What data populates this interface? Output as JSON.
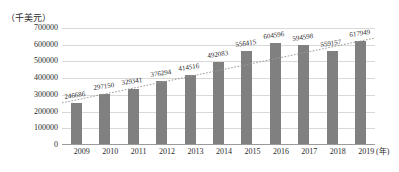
{
  "chart_data": {
    "type": "bar",
    "title": "",
    "subtitle": "",
    "xlabel": "(年)",
    "ylabel": "（千美元）",
    "categories": [
      "2009",
      "2010",
      "2011",
      "2012",
      "2013",
      "2014",
      "2015",
      "2016",
      "2017",
      "2018",
      "2019"
    ],
    "values": [
      246686,
      297150,
      329341,
      376294,
      414516,
      492083,
      556415,
      604596,
      594598,
      559157,
      617949
    ],
    "data_labels": [
      "246686",
      "297150",
      "329341",
      "376294",
      "414516",
      "492083",
      "556415",
      "604596",
      "594598",
      "559157",
      "617949"
    ],
    "ylim": [
      0,
      700000
    ],
    "ytick_values": [
      0,
      100000,
      200000,
      300000,
      400000,
      500000,
      600000,
      700000
    ],
    "ytick_labels": [
      "0",
      "100000",
      "200000",
      "300000",
      "400000",
      "500000",
      "600000",
      "700000"
    ],
    "grid": true,
    "legend": "none",
    "series": [
      {
        "name": "bars",
        "type": "bar",
        "color": "#808080",
        "values": [
          246686,
          297150,
          329341,
          376294,
          414516,
          492083,
          556415,
          604596,
          594598,
          559157,
          617949
        ]
      },
      {
        "name": "trendline",
        "type": "line",
        "style": "dotted",
        "color": "#9a9a9a",
        "start_value": 252000,
        "end_value": 640000
      }
    ],
    "colors": {
      "bar": "#808080",
      "grid": "#d9d9d9",
      "axis": "#9a9a9a",
      "text": "#2b2b2b",
      "background": "#ffffff"
    }
  }
}
